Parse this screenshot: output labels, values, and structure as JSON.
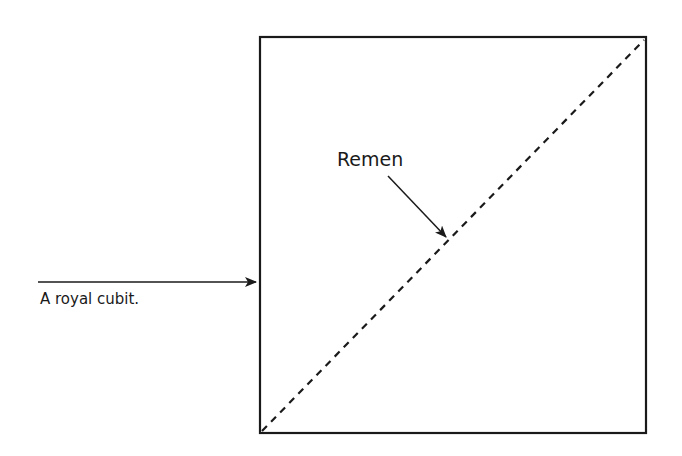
{
  "diagram": {
    "labels": {
      "cubit": "A royal cubit.",
      "remen": "Remen"
    },
    "colors": {
      "stroke": "#1a1a1a",
      "background": "#ffffff"
    },
    "square": {
      "x": 260,
      "y": 37,
      "size": 386
    },
    "diagonal": {
      "style": "dashed",
      "from": "bottom-left",
      "to": "top-right"
    }
  }
}
